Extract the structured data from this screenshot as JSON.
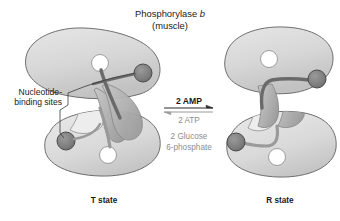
{
  "figure": {
    "title_line1_prefix": "Phosphorylase ",
    "title_line1_italic": "b",
    "title_line2": "(muscle)",
    "annotation": {
      "line1": "Nucleotide-",
      "line2": "binding sites"
    },
    "reaction": {
      "forward_label": "2 AMP",
      "reverse_label_1": "2 ATP",
      "reverse_label_2a": "2 Glucose",
      "reverse_label_2b": "6-phosphate"
    },
    "left_state_label": "T state",
    "right_state_label": "R state",
    "colors": {
      "background": "#ffffff",
      "subunit_body": "#d6d6d6",
      "subunit_body_light": "#e2e2e2",
      "subunit_outline": "#6e6e6e",
      "tower_helix": "#b6b6b6",
      "tower_outline": "#8a8a8a",
      "rod_dark": "#6a6a6a",
      "rod_mid": "#9a9a9a",
      "nucleotide_site": "#7d7d7d",
      "nucleotide_outline": "#4a4a4a",
      "active_site": "#ffffff",
      "text_dark": "#1a1a1a",
      "text_gray": "#8d8d8d",
      "leader_line": "#555555"
    },
    "icons": {
      "active_site": "white-circle-icon",
      "nucleotide_site": "dark-circle-icon",
      "forward_arrow": "arrow-right-icon",
      "reverse_arrow": "arrow-left-icon"
    }
  }
}
